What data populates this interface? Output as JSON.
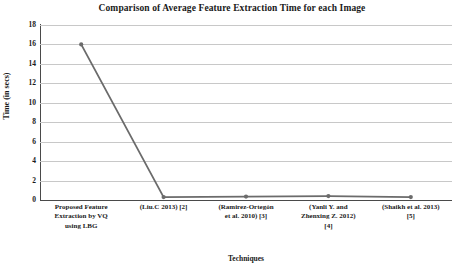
{
  "chart_data": {
    "type": "line",
    "title": "Comparison of Average Feature Extraction Time for each Image",
    "xlabel": "Techniques",
    "ylabel": "Time (in secs)",
    "ylim": [
      0,
      18
    ],
    "ytick_step": 2,
    "yticks": [
      18,
      16,
      14,
      12,
      10,
      8,
      6,
      4,
      2,
      0
    ],
    "grid": true,
    "legend": "none",
    "line_color": "#6b6b6b",
    "marker_color": "#6b6b6b",
    "grid_color": "#c8c8c8",
    "axis_color": "#4a4a4a",
    "categories": [
      "Proposed Feature Extraction by VQ using LBG",
      "(Liu.C 2013) [2]",
      "(Ramirez-Ortegón et al. 2010) [3]",
      "(Yanli Y. and Zhenxing Z. 2012) [4]",
      "(Shaikh et al. 2013) [5]"
    ],
    "category_lines": [
      [
        "Proposed Feature",
        "Extraction by VQ",
        "using LBG"
      ],
      [
        "(Liu.C 2013) [2]"
      ],
      [
        "(Ramirez-Ortegón",
        "et al. 2010) [3]"
      ],
      [
        "(Yanli Y. and",
        "Zhenxing Z. 2012)",
        "[4]"
      ],
      [
        "(Shaikh et al. 2013)",
        "[5]"
      ]
    ],
    "values": [
      16,
      0.3,
      0.35,
      0.4,
      0.3
    ]
  }
}
